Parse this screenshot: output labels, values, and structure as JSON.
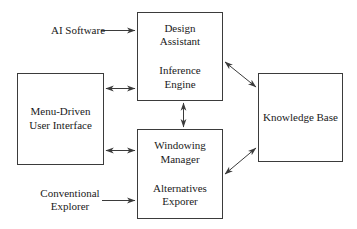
{
  "diagram": {
    "stroke_color": "#3b3b3b",
    "text_color": "#1a1a1a",
    "background": "#ffffff",
    "nodes": [
      {
        "id": "design-assistant",
        "groups": [
          {
            "lines": [
              "Design",
              "Assistant"
            ]
          },
          {
            "lines": [
              "Inference",
              "Engine"
            ]
          }
        ]
      },
      {
        "id": "windowing-manager",
        "groups": [
          {
            "lines": [
              "Windowing",
              "Manager"
            ]
          },
          {
            "lines": [
              "Alternatives",
              "Exporer"
            ]
          }
        ]
      },
      {
        "id": "menu-driven-user-interface",
        "groups": [
          {
            "lines": [
              "Menu-Driven",
              "User Interface"
            ]
          }
        ]
      },
      {
        "id": "knowledge-base",
        "groups": [
          {
            "lines": [
              "Knowledge Base"
            ]
          }
        ]
      }
    ],
    "external_labels": [
      {
        "id": "ai-software",
        "lines": [
          "AI Software"
        ]
      },
      {
        "id": "conventional-explorer",
        "lines": [
          "Conventional",
          "Explorer"
        ]
      }
    ],
    "connectors": [
      {
        "id": "ai-software-to-design-assistant",
        "kind": "arrow-single",
        "from": "AI Software",
        "to": "Design Assistant"
      },
      {
        "id": "conventional-explorer-to-alternatives-exporer",
        "kind": "arrow-single",
        "from": "Conventional Explorer",
        "to": "Alternatives Exporer"
      },
      {
        "id": "menu-ui-to-inference-engine",
        "kind": "arrow-double",
        "from": "Menu-Driven User Interface",
        "to": "Inference Engine"
      },
      {
        "id": "menu-ui-to-windowing-manager",
        "kind": "arrow-double",
        "from": "Menu-Driven User Interface",
        "to": "Windowing Manager"
      },
      {
        "id": "inference-engine-to-windowing-manager",
        "kind": "arrow-double",
        "from": "Inference Engine",
        "to": "Windowing Manager"
      },
      {
        "id": "design-assistant-to-knowledge-base",
        "kind": "arrow-double",
        "from": "Design Assistant",
        "to": "Knowledge Base"
      },
      {
        "id": "windowing-manager-to-knowledge-base",
        "kind": "arrow-double",
        "from": "Windowing Manager",
        "to": "Knowledge Base"
      }
    ]
  }
}
